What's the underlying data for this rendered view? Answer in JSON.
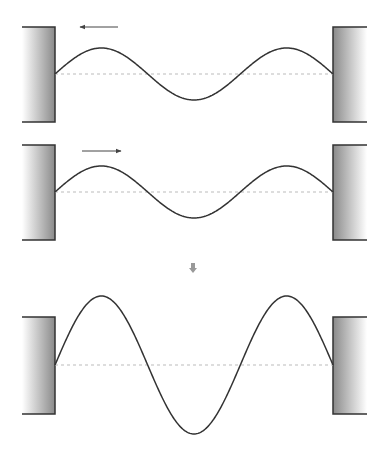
{
  "diagram": {
    "colors": {
      "line": "#333333",
      "baseline": "#bbbbbb",
      "wall_dark": "#777777",
      "wall_light": "#ffffff",
      "arrow": "#444444",
      "down_arrow": "#999999"
    },
    "wave": {
      "x_start": 55,
      "x_end": 333,
      "wavelengths": 1.5
    },
    "panels": [
      {
        "name": "wave-leftward",
        "wall_top": 27,
        "wall_bottom": 122,
        "baseline": 74,
        "amplitude": 26,
        "arrow": {
          "direction": "left",
          "x1": 118,
          "x2": 80,
          "y": 27
        }
      },
      {
        "name": "wave-rightward",
        "wall_top": 145,
        "wall_bottom": 240,
        "baseline": 192,
        "amplitude": 26,
        "arrow": {
          "direction": "right",
          "x1": 82,
          "x2": 121,
          "y": 151
        }
      },
      {
        "name": "standing-wave-sum",
        "wall_top": 317,
        "wall_bottom": 414,
        "baseline": 365,
        "amplitude": 69,
        "arrow": null
      }
    ],
    "combine_arrow": {
      "direction": "down",
      "x": 193,
      "y": 263
    }
  }
}
